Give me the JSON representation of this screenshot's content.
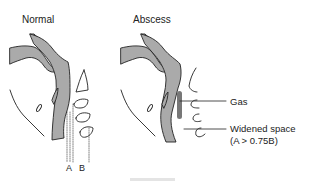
{
  "diagram": {
    "panels": [
      {
        "id": "normal",
        "title": "Normal"
      },
      {
        "id": "abscess",
        "title": "Abscess"
      }
    ],
    "normal_labels": {
      "a": "A",
      "b": "B"
    },
    "abscess_labels": {
      "gas": "Gas",
      "widened_line1": "Widened space",
      "widened_line2": "(A > 0.75B)"
    },
    "colors": {
      "soft_tissue_fill": "#aaaaaa",
      "gas_fill": "#777777",
      "outline": "#222222",
      "background": "#ffffff"
    }
  }
}
